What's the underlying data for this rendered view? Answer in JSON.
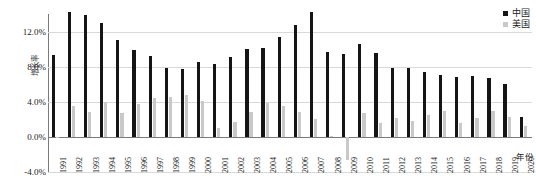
{
  "chart_data": {
    "type": "bar",
    "title": "",
    "xlabel": "年份",
    "ylabel": "增长率",
    "ylim": [
      -4.0,
      14.0
    ],
    "yticks": [
      "12.0%",
      "8.0%",
      "4.0%",
      "0.0%",
      "-4.0%"
    ],
    "ytick_values": [
      12.0,
      8.0,
      4.0,
      0.0,
      -4.0
    ],
    "grid": true,
    "legend_position": "top-right",
    "categories": [
      "1991",
      "1992",
      "1993",
      "1994",
      "1995",
      "1996",
      "1997",
      "1998",
      "1999",
      "2000",
      "2001",
      "2002",
      "2003",
      "2004",
      "2005",
      "2006",
      "2007",
      "2008",
      "2009",
      "2010",
      "2011",
      "2012",
      "2013",
      "2014",
      "2015",
      "2016",
      "2017",
      "2018",
      "2019",
      "2020"
    ],
    "series": [
      {
        "name": "中国",
        "color": "#151515",
        "values": [
          9.3,
          14.2,
          13.9,
          13.0,
          11.0,
          9.9,
          9.2,
          7.8,
          7.7,
          8.5,
          8.3,
          9.1,
          10.0,
          10.1,
          11.4,
          12.7,
          14.2,
          9.7,
          9.4,
          10.6,
          9.6,
          7.9,
          7.8,
          7.4,
          7.0,
          6.8,
          6.9,
          6.7,
          6.0,
          2.3
        ]
      },
      {
        "name": "美国",
        "color": "#c9c9c9",
        "values": [
          -0.1,
          3.5,
          2.8,
          4.0,
          2.7,
          3.8,
          4.4,
          4.5,
          4.8,
          4.1,
          1.0,
          1.7,
          2.8,
          3.9,
          3.5,
          2.8,
          2.0,
          0.1,
          -2.6,
          2.7,
          1.6,
          2.2,
          1.8,
          2.5,
          2.9,
          1.6,
          2.2,
          2.9,
          2.3,
          1.2
        ]
      }
    ]
  },
  "legend": {
    "items": [
      {
        "label": "中国",
        "color": "#151515"
      },
      {
        "label": "美国",
        "color": "#c9c9c9"
      }
    ]
  }
}
